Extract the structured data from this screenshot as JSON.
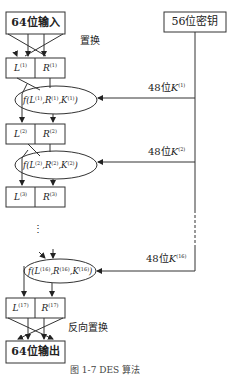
{
  "diagram": {
    "caption": "图 1-7   DES 算法",
    "input_box": "64位输入",
    "output_box": "64位输出",
    "key_box": "56位密钥",
    "initial_permutation_label": "置换",
    "final_permutation_label": "反向置换",
    "ellipsis": "⋮",
    "rows": [
      {
        "L": "L",
        "L_sup": "(1)",
        "R": "R",
        "R_sup": "(1)"
      },
      {
        "L": "L",
        "L_sup": "(2)",
        "R": "R",
        "R_sup": "(2)"
      },
      {
        "L": "L",
        "L_sup": "(3)",
        "R": "R",
        "R_sup": "(3)"
      },
      {
        "L": "L",
        "L_sup": "(17)",
        "R": "R",
        "R_sup": "(17)"
      }
    ],
    "functions": [
      {
        "f": "f(L",
        "l_sup": "(1)",
        "r": ",R",
        "r_sup": "(1)",
        "k": ",K",
        "k_sup": "(1)",
        "end": ")"
      },
      {
        "f": "f(L",
        "l_sup": "(2)",
        "r": ",R",
        "r_sup": "(2)",
        "k": ",K",
        "k_sup": "(2)",
        "end": ")"
      },
      {
        "f": "f(L",
        "l_sup": "(16)",
        "r": ",R",
        "r_sup": "(16)",
        "k": ",K",
        "k_sup": "(16)",
        "end": ")"
      }
    ],
    "subkeys": [
      {
        "prefix": "48位",
        "k": "K",
        "sup": "(1)"
      },
      {
        "prefix": "48位",
        "k": "K",
        "sup": "(2)"
      },
      {
        "prefix": "48位",
        "k": "K",
        "sup": "(16)"
      }
    ]
  }
}
